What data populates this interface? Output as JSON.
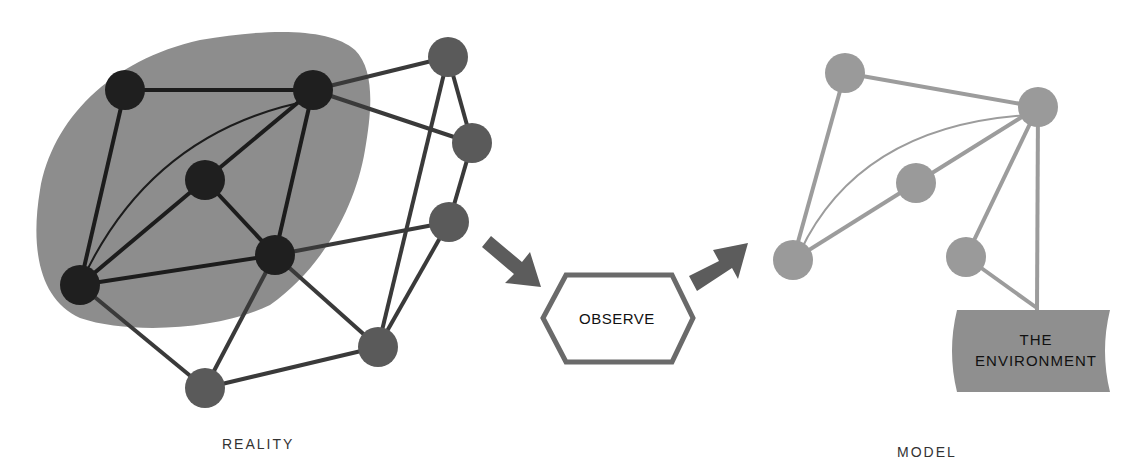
{
  "colors": {
    "blob": "#8d8d8d",
    "dark_node": "#1f1f1f",
    "dark_edge": "#1c1c1c",
    "gray_node": "#5a5a5a",
    "gray_edge": "#4a4a4a",
    "model_node": "#9a9a9a",
    "model_edge": "#9c9c9c",
    "arrow": "#5c5c5c",
    "hexagon_stroke": "#6a6a6a",
    "environment_fill": "#8f8f8f"
  },
  "reality": {
    "label": "REALITY",
    "nodes_inside": [
      [
        125,
        90
      ],
      [
        313,
        90
      ],
      [
        205,
        180
      ],
      [
        275,
        255
      ],
      [
        80,
        285
      ]
    ],
    "nodes_outside": [
      [
        448,
        57
      ],
      [
        472,
        143
      ],
      [
        449,
        222
      ],
      [
        378,
        347
      ],
      [
        205,
        388
      ]
    ]
  },
  "process": {
    "label": "OBSERVE"
  },
  "model": {
    "label": "MODEL",
    "nodes": [
      [
        845,
        73
      ],
      [
        1038,
        107
      ],
      [
        916,
        183
      ],
      [
        793,
        260
      ],
      [
        966,
        257
      ]
    ],
    "environment": {
      "line1": "THE",
      "line2": "ENVIRONMENT"
    }
  }
}
